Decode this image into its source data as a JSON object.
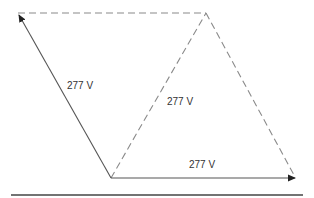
{
  "diagram": {
    "type": "phasor-vector-diagram",
    "colors": {
      "solid_line": "#555555",
      "dashed_line": "#8a8a8a",
      "baseline": "#444444",
      "label": "#333333"
    },
    "points": {
      "bottom_left": [
        111,
        178
      ],
      "top_left": [
        18,
        13
      ],
      "top_right": [
        206,
        13
      ],
      "bottom_right": [
        296,
        178
      ]
    },
    "vectors": [
      {
        "id": "left-phasor",
        "from": "bottom_left",
        "to": "top_left",
        "style": "solid",
        "arrow": true,
        "label": "277 V"
      },
      {
        "id": "bottom-phasor",
        "from": "bottom_left",
        "to": "bottom_right",
        "style": "solid",
        "arrow": true,
        "label": "277 V"
      }
    ],
    "dashed_lines": [
      {
        "id": "top-dashed",
        "from": "top_left",
        "to": "top_right"
      },
      {
        "id": "middle-dashed",
        "from": "bottom_left",
        "to": "top_right",
        "label": "277 V"
      },
      {
        "id": "right-dashed",
        "from": "top_right",
        "to": "bottom_right"
      }
    ],
    "labels": {
      "left": "277 V",
      "middle": "277 V",
      "bottom": "277 V"
    },
    "baseline": {
      "x1": 11,
      "x2": 303,
      "y": 195
    }
  }
}
